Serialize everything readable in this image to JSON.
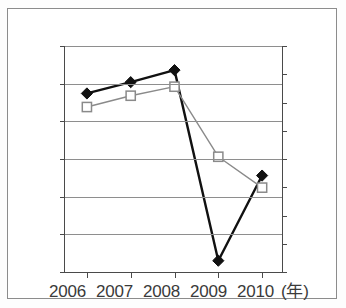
{
  "figure": {
    "caption_remnant": "",
    "frame_color": "#8c8c8c",
    "background": "#ffffff"
  },
  "axes": {
    "left": {
      "ticks": [
        "1.10",
        "1.05",
        "1.00",
        "0.95",
        "0.90",
        "0.85",
        "0.80"
      ],
      "min": 0.8,
      "max": 1.1,
      "step": 0.05
    },
    "right": {
      "ticks": [
        "6.00%",
        "5.00%",
        "4.00%",
        "3.00%",
        "2.00%",
        "1.00%",
        "0.00%",
        "-1.00%",
        "-2.00%"
      ],
      "min": -2.0,
      "max": 6.0,
      "step": 1.0
    },
    "x": {
      "ticks": [
        "2006",
        "2007",
        "2008",
        "2009",
        "2010"
      ],
      "unit_label": "(年)"
    }
  },
  "colors": {
    "series_black": "#111111",
    "series_gray": "#8a8a8a",
    "gridline": "#8e8e8e",
    "axis": "#4a4a4a",
    "text": "#3a3a3a"
  },
  "chart_data": {
    "type": "line",
    "title": "",
    "subtitle": "",
    "xlabel": "(年)",
    "ylabel": "",
    "x": [
      "2006",
      "2007",
      "2008",
      "2009",
      "2010"
    ],
    "categories": [
      "2006",
      "2007",
      "2008",
      "2009",
      "2010"
    ],
    "grid": true,
    "legend": "none",
    "ylim": [
      0.8,
      1.1
    ],
    "y2lim": [
      -0.02,
      0.06
    ],
    "yticks": [
      "1.10",
      "1.05",
      "1.00",
      "0.95",
      "0.90",
      "0.85",
      "0.80"
    ],
    "y2ticks": [
      "6.00%",
      "5.00%",
      "4.00%",
      "3.00%",
      "2.00%",
      "1.00%",
      "0.00%",
      "-1.00%",
      "-2.00%"
    ],
    "series": [
      {
        "name": "black-diamond-series",
        "axis": "left",
        "marker": "filled-diamond",
        "color": "#111111",
        "values": [
          1.037,
          1.052,
          1.068,
          0.815,
          0.928
        ]
      },
      {
        "name": "gray-square-series",
        "axis": "right",
        "marker": "open-square",
        "color": "#8a8a8a",
        "values_percent": [
          3.8,
          4.25,
          4.6,
          2.05,
          0.95
        ],
        "values_left_scale": [
          1.019,
          1.034,
          1.046,
          0.953,
          0.912
        ]
      }
    ],
    "annotations": []
  }
}
